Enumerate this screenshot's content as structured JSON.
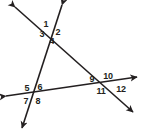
{
  "figure": {
    "type": "geometry-diagram",
    "canvas": {
      "width": 142,
      "height": 137
    },
    "colors": {
      "background": "#ffffff",
      "stroke": "#231f20",
      "label_text": "#231f20"
    },
    "stroke_width": 1.6,
    "lines": [
      {
        "id": "line-a",
        "name": "upper-left-to-lower-right-line",
        "from": {
          "x": 15,
          "y": 7
        },
        "to": {
          "x": 133,
          "y": 112
        },
        "arrow_start": true,
        "arrow_end": true
      },
      {
        "id": "line-b",
        "name": "upper-right-to-lower-left-line",
        "from": {
          "x": 62,
          "y": 5
        },
        "to": {
          "x": 22,
          "y": 128
        },
        "arrow_start": true,
        "arrow_end": true
      },
      {
        "id": "line-c",
        "name": "left-to-right-transversal-line",
        "from": {
          "x": 6,
          "y": 96
        },
        "to": {
          "x": 137,
          "y": 77
        },
        "arrow_start": true,
        "arrow_end": true
      }
    ],
    "intersections": [
      {
        "id": "top-intersection",
        "name": "top-vertex",
        "x": 51,
        "y": 31,
        "angles": [
          "1",
          "2",
          "3",
          "4"
        ]
      },
      {
        "id": "bottom-left-intersection",
        "name": "bottom-left-vertex",
        "x": 33,
        "y": 94,
        "angles": [
          "5",
          "6",
          "7",
          "8"
        ]
      },
      {
        "id": "bottom-right-intersection",
        "name": "bottom-right-vertex",
        "x": 103,
        "y": 84,
        "angles": [
          "9",
          "10",
          "11",
          "12"
        ]
      }
    ],
    "angle_labels": [
      {
        "id": "angle-1",
        "text": "1",
        "x": 46,
        "y": 24,
        "vertex": "top-intersection",
        "position": "upper-left"
      },
      {
        "id": "angle-2",
        "text": "2",
        "x": 58,
        "y": 32,
        "vertex": "top-intersection",
        "position": "upper-right"
      },
      {
        "id": "angle-3",
        "text": "3",
        "x": 42,
        "y": 34,
        "vertex": "top-intersection",
        "position": "lower-left"
      },
      {
        "id": "angle-4",
        "text": "4",
        "x": 52,
        "y": 41,
        "vertex": "top-intersection",
        "position": "lower-right"
      },
      {
        "id": "angle-5",
        "text": "5",
        "x": 27,
        "y": 88,
        "vertex": "bottom-left-intersection",
        "position": "upper-left"
      },
      {
        "id": "angle-6",
        "text": "6",
        "x": 40,
        "y": 87,
        "vertex": "bottom-left-intersection",
        "position": "upper-right"
      },
      {
        "id": "angle-7",
        "text": "7",
        "x": 26,
        "y": 101,
        "vertex": "bottom-left-intersection",
        "position": "lower-left"
      },
      {
        "id": "angle-8",
        "text": "8",
        "x": 38,
        "y": 101,
        "vertex": "bottom-left-intersection",
        "position": "lower-right"
      },
      {
        "id": "angle-9",
        "text": "9",
        "x": 92,
        "y": 79,
        "vertex": "bottom-right-intersection",
        "position": "upper-left"
      },
      {
        "id": "angle-10",
        "text": "10",
        "x": 108,
        "y": 76,
        "vertex": "bottom-right-intersection",
        "position": "upper-right"
      },
      {
        "id": "angle-11",
        "text": "11",
        "x": 101,
        "y": 91,
        "vertex": "bottom-right-intersection",
        "position": "lower-left"
      },
      {
        "id": "angle-12",
        "text": "12",
        "x": 121,
        "y": 89,
        "vertex": "bottom-right-intersection",
        "position": "lower-right"
      }
    ]
  }
}
